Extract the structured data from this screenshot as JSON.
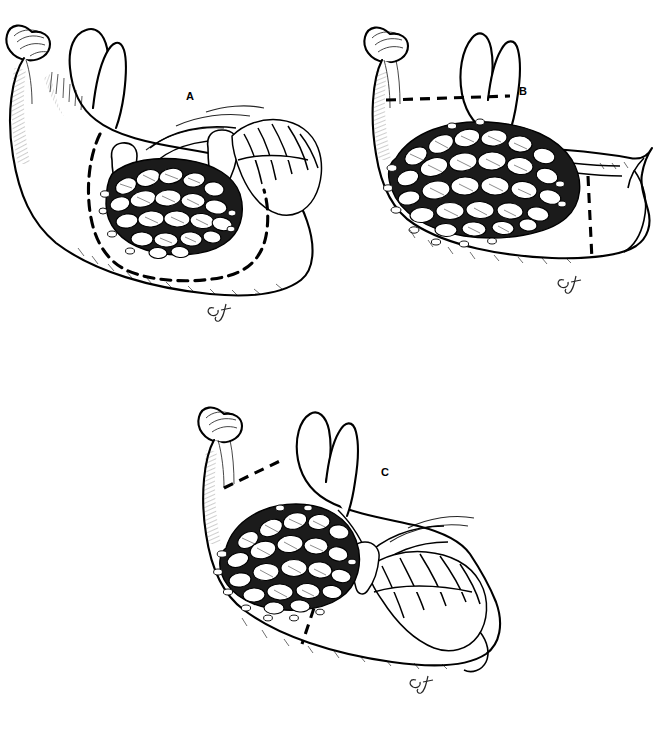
{
  "page": {
    "background": "#ffffff",
    "ink": "#000000",
    "width": 671,
    "height": 741
  },
  "caption": {
    "marker": "diamond-outline-icon",
    "text": "Figure 23-8",
    "rule_color": "#8a8a8a"
  },
  "panels": [
    {
      "id": "a",
      "label": "A",
      "subject": "mandible-lateral-view-with-multilocular-lesion",
      "dentition": "dentate",
      "resection": "marginal-resection-outline",
      "resection_lines": 1,
      "signature": "CJ"
    },
    {
      "id": "b",
      "label": "B",
      "subject": "mandible-lateral-view-with-expansile-multilocular-lesion",
      "dentition": "edentulous",
      "resection": "segmental-resection-lines",
      "resection_lines": 2,
      "signature": "CJ"
    },
    {
      "id": "c",
      "label": "C",
      "subject": "mandible-lateral-view-with-posterior-multilocular-lesion",
      "dentition": "dentate",
      "resection": "segmental-resection-lines",
      "resection_lines": 2,
      "signature": "CJ"
    }
  ]
}
